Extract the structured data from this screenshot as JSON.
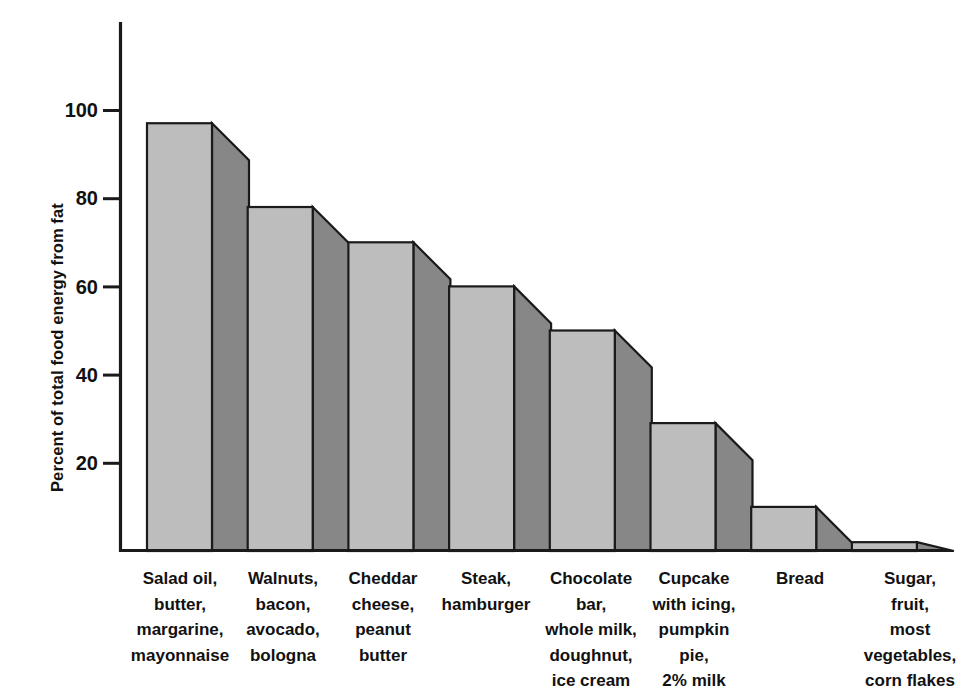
{
  "chart_data": {
    "type": "bar",
    "title": "",
    "subtitle": "",
    "xlabel": "",
    "ylabel": "Percent of total food energy from fat",
    "ylim": [
      0,
      115
    ],
    "ytick_values": [
      20,
      40,
      60,
      80,
      100
    ],
    "ytick_labels": [
      "20",
      "40",
      "60",
      "80",
      "100"
    ],
    "grid": false,
    "legend": null,
    "style": "3d-shaded-bars",
    "categories": [
      "Salad oil,\nbutter,\nmargarine,\nmayonnaise",
      "Walnuts,\nbacon,\navocado,\nbologna",
      "Cheddar\ncheese,\npeanut\nbutter",
      "Steak,\nhamburger",
      "Chocolate\nbar,\nwhole milk,\ndoughnut,\nice cream",
      "Cupcake\nwith icing,\npumpkin\npie,\n2% milk",
      "Bread",
      "Sugar,\nfruit,\nmost\nvegetables,\ncorn flakes"
    ],
    "values": [
      97,
      78,
      70,
      60,
      50,
      29,
      10,
      2
    ]
  },
  "colors": {
    "bar_front": "#bdbdbd",
    "bar_side": "#878787",
    "outline": "#1a1a1a",
    "axis": "#1a1a1a",
    "text": "#111111",
    "background": "#ffffff"
  },
  "axis": {
    "y_label": "Percent of total food energy from fat",
    "y_ticks": [
      "100",
      "80",
      "60",
      "40",
      "20"
    ]
  }
}
